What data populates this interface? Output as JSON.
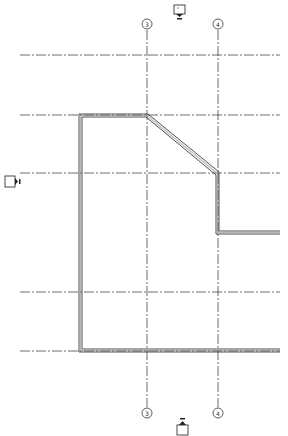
{
  "drawing": {
    "type": "floor-plan",
    "background": "#ffffff",
    "line_color": "#3a3a3a",
    "grid_color": "#444444"
  },
  "grid": {
    "vertical": [
      {
        "label": "3",
        "x": 147,
        "bubble_top_y": 24,
        "bubble_bottom_y": 413
      },
      {
        "label": "4",
        "x": 218,
        "bubble_top_y": 24,
        "bubble_bottom_y": 413
      }
    ],
    "horizontal": [
      {
        "y": 55,
        "x1": 20,
        "x2": 280
      },
      {
        "y": 115,
        "x1": 20,
        "x2": 280
      },
      {
        "y": 173,
        "x1": 20,
        "x2": 280
      },
      {
        "y": 292,
        "x1": 20,
        "x2": 280
      },
      {
        "y": 351,
        "x1": 20,
        "x2": 280
      }
    ]
  },
  "markers": {
    "elevation_top": {
      "label": "",
      "x": 180,
      "y": 12,
      "direction": "down"
    },
    "elevation_bottom": {
      "label": "",
      "x": 182,
      "y": 424,
      "direction": "up"
    },
    "elevation_left": {
      "label": "",
      "x": 13,
      "y": 181,
      "direction": "right"
    }
  },
  "wall_outline": {
    "points": [
      [
        80,
        115
      ],
      [
        147,
        115
      ],
      [
        218,
        173
      ],
      [
        218,
        232
      ],
      [
        280,
        232
      ]
    ],
    "points_bottom": [
      [
        80,
        115
      ],
      [
        80,
        351
      ],
      [
        280,
        351
      ]
    ]
  }
}
